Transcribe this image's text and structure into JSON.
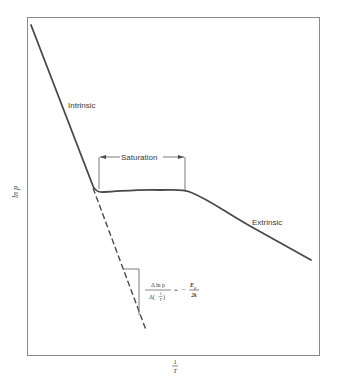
{
  "diagram": {
    "axes": {
      "y_label": "ln p",
      "x_label_num": "1",
      "x_label_den": "T"
    },
    "regions": {
      "intrinsic": "Intrinsic",
      "saturation": "Saturation",
      "extrinsic": "Extrinsic"
    },
    "slope_equation": {
      "lhs_num": "Δ ln p",
      "lhs_den_prefix": "Δ(",
      "lhs_den_frac_num": "1",
      "lhs_den_frac_den": "T",
      "lhs_den_suffix": ")",
      "equals": "=",
      "minus": "−",
      "rhs_num": "E",
      "rhs_num_sub": "g",
      "rhs_den": "2k"
    },
    "colors": {
      "line": "#4a4a4a",
      "frame": "#8a8a8a",
      "text": "#3a3a3a"
    }
  }
}
